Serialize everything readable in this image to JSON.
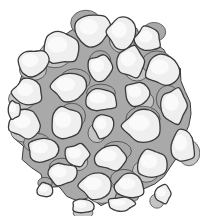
{
  "illustration": {
    "subject": "cell-cluster",
    "colors": {
      "background": "#ffffff",
      "matrix": "#a9a9a9",
      "matrix_light": "#c4c4c4",
      "cell_fill": "#efefef",
      "cell_highlight": "#fafafa",
      "outline": "#3a3a3a"
    },
    "cluster": {
      "cx": 101,
      "cy": 114,
      "r": 94
    },
    "cells": [
      {
        "cx": 92,
        "cy": 30,
        "rx": 17,
        "ry": 16,
        "rot": -10
      },
      {
        "cx": 122,
        "cy": 33,
        "rx": 14,
        "ry": 16,
        "rot": 5
      },
      {
        "cx": 148,
        "cy": 39,
        "rx": 13,
        "ry": 12,
        "rot": 0
      },
      {
        "cx": 61,
        "cy": 48,
        "rx": 18,
        "ry": 16,
        "rot": 10
      },
      {
        "cx": 100,
        "cy": 68,
        "rx": 12,
        "ry": 13,
        "rot": 0
      },
      {
        "cx": 131,
        "cy": 62,
        "rx": 14,
        "ry": 15,
        "rot": -5
      },
      {
        "cx": 163,
        "cy": 70,
        "rx": 17,
        "ry": 15,
        "rot": 10
      },
      {
        "cx": 33,
        "cy": 63,
        "rx": 15,
        "ry": 13,
        "rot": -15
      },
      {
        "cx": 69,
        "cy": 87,
        "rx": 17,
        "ry": 14,
        "rot": 0
      },
      {
        "cx": 28,
        "cy": 92,
        "rx": 15,
        "ry": 13,
        "rot": 0
      },
      {
        "cx": 101,
        "cy": 100,
        "rx": 16,
        "ry": 11,
        "rot": 0
      },
      {
        "cx": 137,
        "cy": 94,
        "rx": 12,
        "ry": 12,
        "rot": 0
      },
      {
        "cx": 174,
        "cy": 106,
        "rx": 13,
        "ry": 17,
        "rot": 0
      },
      {
        "cx": 25,
        "cy": 124,
        "rx": 16,
        "ry": 14,
        "rot": 10
      },
      {
        "cx": 66,
        "cy": 123,
        "rx": 15,
        "ry": 16,
        "rot": 0
      },
      {
        "cx": 103,
        "cy": 126,
        "rx": 10,
        "ry": 12,
        "rot": 0
      },
      {
        "cx": 143,
        "cy": 126,
        "rx": 19,
        "ry": 16,
        "rot": 0
      },
      {
        "cx": 183,
        "cy": 146,
        "rx": 12,
        "ry": 16,
        "rot": 0
      },
      {
        "cx": 43,
        "cy": 150,
        "rx": 15,
        "ry": 12,
        "rot": -5
      },
      {
        "cx": 77,
        "cy": 155,
        "rx": 12,
        "ry": 11,
        "rot": 0
      },
      {
        "cx": 111,
        "cy": 158,
        "rx": 16,
        "ry": 12,
        "rot": 0
      },
      {
        "cx": 152,
        "cy": 164,
        "rx": 15,
        "ry": 14,
        "rot": 0
      },
      {
        "cx": 62,
        "cy": 174,
        "rx": 14,
        "ry": 11,
        "rot": 0
      },
      {
        "cx": 96,
        "cy": 186,
        "rx": 16,
        "ry": 13,
        "rot": 0
      },
      {
        "cx": 130,
        "cy": 186,
        "rx": 15,
        "ry": 12,
        "rot": 0
      },
      {
        "cx": 83,
        "cy": 206,
        "rx": 11,
        "ry": 7,
        "rot": 0
      },
      {
        "cx": 121,
        "cy": 204,
        "rx": 13,
        "ry": 7,
        "rot": 0
      },
      {
        "cx": 163,
        "cy": 194,
        "rx": 8,
        "ry": 9,
        "rot": 0
      },
      {
        "cx": 45,
        "cy": 190,
        "rx": 8,
        "ry": 7,
        "rot": 0
      },
      {
        "cx": 14,
        "cy": 110,
        "rx": 6,
        "ry": 9,
        "rot": 0
      }
    ]
  }
}
